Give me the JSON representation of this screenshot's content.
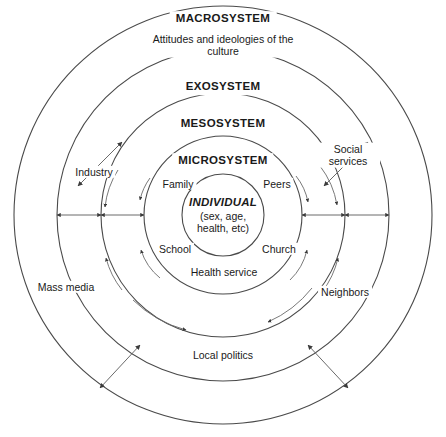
{
  "diagram": {
    "type": "concentric-systems",
    "stroke_color": "#4a4a4a",
    "text_color": "#1a1a1a",
    "background_color": "#ffffff",
    "center": {
      "x": 223,
      "y": 215
    },
    "rings": [
      {
        "id": "macrosystem",
        "label": "MACROSYSTEM",
        "sublabel": "Attitudes and ideologies of the culture",
        "radius": 209
      },
      {
        "id": "exosystem",
        "label": "EXOSYSTEM",
        "sublabel": "",
        "radius": 166
      },
      {
        "id": "mesosystem",
        "label": "MESOSYSTEM",
        "sublabel": "",
        "radius": 122
      },
      {
        "id": "microsystem",
        "label": "MICROSYSTEM",
        "sublabel": "",
        "radius": 79
      },
      {
        "id": "individual",
        "label": "INDIVIDUAL",
        "sublabel": "(sex, age, health, etc)",
        "radius": 41
      }
    ],
    "core": {
      "title": "INDIVIDUAL",
      "line_1": "(sex, age,",
      "line_2": "health, etc)"
    },
    "microsystem_labels": [
      {
        "id": "family",
        "text": "Family"
      },
      {
        "id": "peers",
        "text": "Peers"
      },
      {
        "id": "school",
        "text": "School"
      },
      {
        "id": "church",
        "text": "Church"
      },
      {
        "id": "health-service",
        "text": "Health service"
      }
    ],
    "exosystem_labels": [
      {
        "id": "industry",
        "text": "Industry"
      },
      {
        "id": "mass-media",
        "text": "Mass media"
      },
      {
        "id": "social-services",
        "text": "Social services"
      },
      {
        "id": "neighbors",
        "text": "Neighbors"
      },
      {
        "id": "local-politics",
        "text": "Local politics"
      }
    ]
  }
}
